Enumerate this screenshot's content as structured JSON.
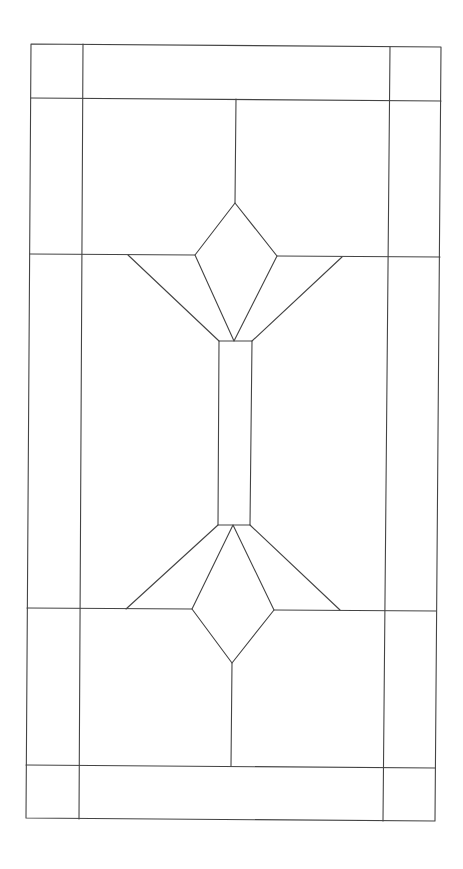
{
  "diagram": {
    "type": "stained-glass-pattern",
    "stroke": "#444444",
    "stroke_width": 1.1,
    "background": "#ffffff",
    "outer_frame": [
      [
        31,
        44
      ],
      [
        441,
        47
      ],
      [
        435,
        821
      ],
      [
        26,
        818
      ]
    ],
    "lines": [
      {
        "name": "border-inner-left",
        "pts": [
          [
            83,
            44
          ],
          [
            79,
            819
          ]
        ]
      },
      {
        "name": "border-inner-right",
        "pts": [
          [
            390,
            47
          ],
          [
            383,
            821
          ]
        ]
      },
      {
        "name": "border-top-rail",
        "pts": [
          [
            31,
            98
          ],
          [
            441,
            101
          ]
        ]
      },
      {
        "name": "border-bottom-rail",
        "pts": [
          [
            26,
            765
          ],
          [
            435,
            768
          ]
        ]
      },
      {
        "name": "top-center-stem",
        "pts": [
          [
            236,
            99
          ],
          [
            235,
            203
          ]
        ]
      },
      {
        "name": "upper-left-rail",
        "pts": [
          [
            30,
            254
          ],
          [
            195,
            255
          ]
        ]
      },
      {
        "name": "upper-right-rail",
        "pts": [
          [
            277,
            256
          ],
          [
            440,
            257
          ]
        ]
      },
      {
        "name": "upper-left-fan",
        "pts": [
          [
            128,
            255
          ],
          [
            219,
            341
          ]
        ]
      },
      {
        "name": "upper-right-fan",
        "pts": [
          [
            342,
            257
          ],
          [
            252,
            341
          ]
        ]
      },
      {
        "name": "lower-left-rail",
        "pts": [
          [
            27,
            608
          ],
          [
            192,
            609
          ]
        ]
      },
      {
        "name": "lower-right-rail",
        "pts": [
          [
            274,
            610
          ],
          [
            436,
            611
          ]
        ]
      },
      {
        "name": "lower-left-fan",
        "pts": [
          [
            126,
            609
          ],
          [
            218,
            525
          ]
        ]
      },
      {
        "name": "lower-right-fan",
        "pts": [
          [
            340,
            610
          ],
          [
            250,
            525
          ]
        ]
      },
      {
        "name": "bottom-center-stem",
        "pts": [
          [
            232,
            663
          ],
          [
            231,
            766
          ]
        ]
      }
    ],
    "polygons": [
      {
        "name": "upper-diamond",
        "pts": [
          [
            235,
            203
          ],
          [
            277,
            256
          ],
          [
            234,
            341
          ],
          [
            195,
            255
          ]
        ]
      },
      {
        "name": "center-bar",
        "pts": [
          [
            219,
            341
          ],
          [
            252,
            341
          ],
          [
            250,
            525
          ],
          [
            218,
            525
          ]
        ]
      },
      {
        "name": "lower-diamond",
        "pts": [
          [
            233,
            525
          ],
          [
            274,
            610
          ],
          [
            232,
            663
          ],
          [
            192,
            609
          ]
        ]
      }
    ]
  }
}
